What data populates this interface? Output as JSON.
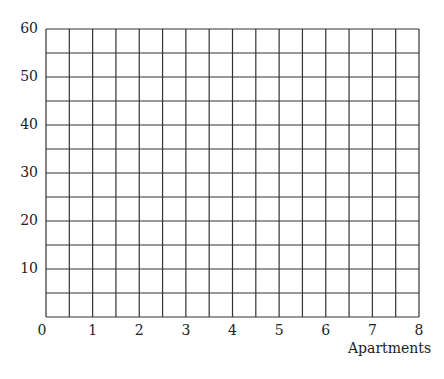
{
  "chart_data": {
    "type": "table",
    "title": "",
    "xlabel": "Apartments",
    "ylabel": "",
    "xlim": [
      0,
      8
    ],
    "ylim": [
      0,
      60
    ],
    "x_ticks": [
      "0",
      "1",
      "2",
      "3",
      "4",
      "5",
      "6",
      "7",
      "8"
    ],
    "y_ticks": [
      "10",
      "20",
      "30",
      "40",
      "50",
      "60"
    ],
    "grid": true,
    "grid_columns": 16,
    "grid_rows": 12,
    "series": []
  },
  "style": {
    "grid_color": "#333333",
    "text_color": "#222222"
  }
}
